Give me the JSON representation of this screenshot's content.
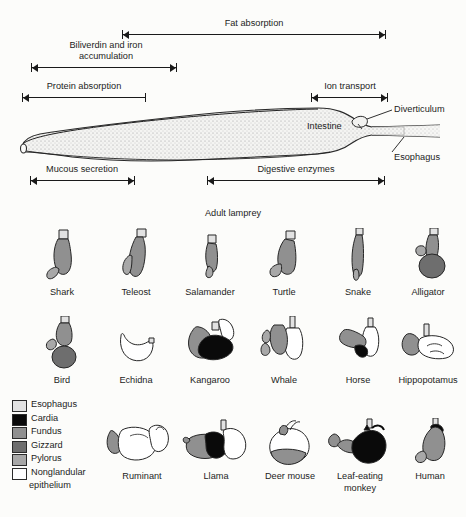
{
  "figure": {
    "title_lamprey": "Adult lamprey",
    "organ_labels": {
      "intestine": "Intestine",
      "diverticulum": "Diverticulum",
      "esophagus": "Esophagus"
    },
    "function_brackets": [
      {
        "id": "fat-absorption",
        "label": "Fat absorption",
        "x1": 122,
        "x2": 386,
        "y": 30,
        "arrow_left": true,
        "arrow_right": true,
        "tick_left": true,
        "tick_right": true
      },
      {
        "id": "biliverdin-iron",
        "label": "Biliverdin and iron accumulation",
        "x1": 31,
        "x2": 177,
        "y": 63,
        "arrow_left": true,
        "arrow_right": true,
        "tick_left": true,
        "tick_right": true
      },
      {
        "id": "protein-absorption",
        "label": "Protein absorption",
        "x1": 22,
        "x2": 146,
        "y": 93,
        "arrow_left": true,
        "arrow_right": false,
        "tick_left": true,
        "tick_right": true
      },
      {
        "id": "ion-transport",
        "label": "Ion transport",
        "x1": 311,
        "x2": 388,
        "y": 93,
        "arrow_left": true,
        "arrow_right": true,
        "tick_left": true,
        "tick_right": true
      },
      {
        "id": "mucous-secretion",
        "label": "Mucous secretion",
        "x1": 30,
        "x2": 135,
        "y": 176,
        "arrow_left": true,
        "arrow_right": true,
        "tick_left": true,
        "tick_right": true
      },
      {
        "id": "digestive-enzymes",
        "label": "Digestive enzymes",
        "x1": 207,
        "x2": 385,
        "y": 176,
        "arrow_left": true,
        "arrow_right": true,
        "tick_left": true,
        "tick_right": true
      }
    ]
  },
  "legend": {
    "items": [
      {
        "label": "Esophagus",
        "color": "#e2e2e2"
      },
      {
        "label": "Cardia",
        "color": "#0a0a0a"
      },
      {
        "label": "Fundus",
        "color": "#909090"
      },
      {
        "label": "Gizzard",
        "color": "#6e6e6e"
      },
      {
        "label": "Pylorus",
        "color": "#a8a8a8"
      },
      {
        "label": "Nonglandular",
        "label2": "epithelium",
        "color": "#ffffff"
      }
    ]
  },
  "rows": [
    {
      "id": "row-vertebrates-1",
      "animals": [
        {
          "name": "Shark"
        },
        {
          "name": "Teleost"
        },
        {
          "name": "Salamander"
        },
        {
          "name": "Turtle"
        },
        {
          "name": "Snake"
        },
        {
          "name": "Alligator"
        }
      ]
    },
    {
      "id": "row-vertebrates-2",
      "animals": [
        {
          "name": "Bird"
        },
        {
          "name": "Echidna"
        },
        {
          "name": "Kangaroo"
        },
        {
          "name": "Whale"
        },
        {
          "name": "Horse"
        },
        {
          "name": "Hippopotamus"
        }
      ]
    },
    {
      "id": "row-vertebrates-3",
      "animals": [
        {
          "name": "Ruminant"
        },
        {
          "name": "Llama"
        },
        {
          "name": "Deer mouse"
        },
        {
          "name": "Leaf-eating",
          "name2": "monkey"
        },
        {
          "name": "Human"
        }
      ]
    }
  ],
  "colors": {
    "esophagus": "#e2e2e2",
    "cardia": "#0a0a0a",
    "fundus": "#909090",
    "gizzard": "#6e6e6e",
    "pylorus": "#a8a8a8",
    "nonglandular": "#ffffff",
    "outline": "#262626",
    "background": "#fcfcfa"
  }
}
